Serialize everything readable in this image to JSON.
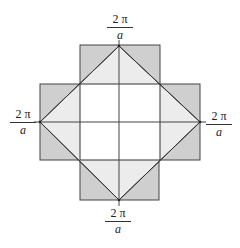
{
  "diagram": {
    "type": "brillouin-zones-square-lattice",
    "labels": {
      "top": {
        "numerator": "2 π",
        "denominator": "a"
      },
      "bottom": {
        "numerator": "2 π",
        "denominator": "a"
      },
      "left": {
        "numerator": "2 π",
        "denominator": "a"
      },
      "right": {
        "numerator": "2 π",
        "denominator": "a"
      }
    },
    "colors": {
      "zone1": "#ffffff",
      "zone2": "#ececec",
      "zone3": "#cfcfcf",
      "line": "#333333"
    }
  }
}
